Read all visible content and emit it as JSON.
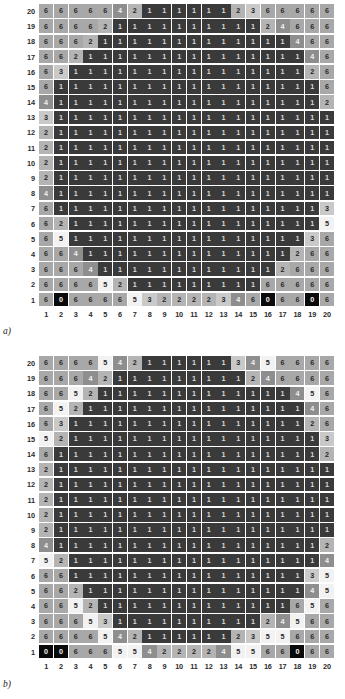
{
  "figure": {
    "panels": [
      {
        "tag": "a)",
        "name": "panel-a"
      },
      {
        "tag": "b)",
        "name": "panel-b"
      }
    ],
    "x_tick_labels": [
      "1",
      "2",
      "3",
      "4",
      "5",
      "6",
      "7",
      "8",
      "9",
      "10",
      "11",
      "12",
      "13",
      "14",
      "15",
      "16",
      "17",
      "18",
      "19",
      "20"
    ],
    "y_tick_labels": [
      "20",
      "19",
      "18",
      "17",
      "16",
      "15",
      "14",
      "13",
      "12",
      "11",
      "10",
      "9",
      "8",
      "7",
      "6",
      "5",
      "4",
      "3",
      "2",
      "1"
    ]
  },
  "legend": {
    "value_colors": {
      "0": "#0a0a0a",
      "1": "#3a3a3a",
      "2": "#b4b4b4",
      "3": "#c9c9c9",
      "4": "#8e8e8e",
      "5": "#f2f2f2",
      "6": "#a8a8a8"
    },
    "value_text_colors": {
      "0": "#f5f5f5",
      "1": "#d8d8d8",
      "2": "#262626",
      "3": "#262626",
      "4": "#f0f0f0",
      "5": "#262626",
      "6": "#2a2a2a"
    }
  },
  "chart_data": [
    {
      "type": "heatmap",
      "name": "panel-a",
      "title": "a)",
      "xlabel": "",
      "ylabel": "",
      "x": [
        1,
        2,
        3,
        4,
        5,
        6,
        7,
        8,
        9,
        10,
        11,
        12,
        13,
        14,
        15,
        16,
        17,
        18,
        19,
        20
      ],
      "y": [
        20,
        19,
        18,
        17,
        16,
        15,
        14,
        13,
        12,
        11,
        10,
        9,
        8,
        7,
        6,
        5,
        4,
        3,
        2,
        1
      ],
      "colorscale": "grayscale-discrete",
      "vmin": 0,
      "vmax": 6,
      "grid": true,
      "legend_position": "none",
      "cell_labels": true,
      "values": [
        [
          6,
          6,
          6,
          6,
          6,
          4,
          2,
          1,
          1,
          1,
          1,
          1,
          1,
          2,
          3,
          6,
          6,
          6,
          6,
          6
        ],
        [
          6,
          6,
          6,
          6,
          2,
          1,
          1,
          1,
          1,
          1,
          1,
          1,
          1,
          1,
          1,
          2,
          4,
          6,
          6,
          6
        ],
        [
          6,
          6,
          6,
          2,
          1,
          1,
          1,
          1,
          1,
          1,
          1,
          1,
          1,
          1,
          1,
          1,
          1,
          4,
          6,
          6
        ],
        [
          6,
          6,
          2,
          1,
          1,
          1,
          1,
          1,
          1,
          1,
          1,
          1,
          1,
          1,
          1,
          1,
          1,
          1,
          4,
          6
        ],
        [
          6,
          3,
          1,
          1,
          1,
          1,
          1,
          1,
          1,
          1,
          1,
          1,
          1,
          1,
          1,
          1,
          1,
          1,
          2,
          6
        ],
        [
          6,
          1,
          1,
          1,
          1,
          1,
          1,
          1,
          1,
          1,
          1,
          1,
          1,
          1,
          1,
          1,
          1,
          1,
          1,
          6
        ],
        [
          4,
          1,
          1,
          1,
          1,
          1,
          1,
          1,
          1,
          1,
          1,
          1,
          1,
          1,
          1,
          1,
          1,
          1,
          1,
          2
        ],
        [
          3,
          1,
          1,
          1,
          1,
          1,
          1,
          1,
          1,
          1,
          1,
          1,
          1,
          1,
          1,
          1,
          1,
          1,
          1,
          1
        ],
        [
          2,
          1,
          1,
          1,
          1,
          1,
          1,
          1,
          1,
          1,
          1,
          1,
          1,
          1,
          1,
          1,
          1,
          1,
          1,
          1
        ],
        [
          2,
          1,
          1,
          1,
          1,
          1,
          1,
          1,
          1,
          1,
          1,
          1,
          1,
          1,
          1,
          1,
          1,
          1,
          1,
          1
        ],
        [
          2,
          1,
          1,
          1,
          1,
          1,
          1,
          1,
          1,
          1,
          1,
          1,
          1,
          1,
          1,
          1,
          1,
          1,
          1,
          1
        ],
        [
          2,
          1,
          1,
          1,
          1,
          1,
          1,
          1,
          1,
          1,
          1,
          1,
          1,
          1,
          1,
          1,
          1,
          1,
          1,
          1
        ],
        [
          4,
          1,
          1,
          1,
          1,
          1,
          1,
          1,
          1,
          1,
          1,
          1,
          1,
          1,
          1,
          1,
          1,
          1,
          1,
          1
        ],
        [
          6,
          1,
          1,
          1,
          1,
          1,
          1,
          1,
          1,
          1,
          1,
          1,
          1,
          1,
          1,
          1,
          1,
          1,
          1,
          3
        ],
        [
          6,
          2,
          1,
          1,
          1,
          1,
          1,
          1,
          1,
          1,
          1,
          1,
          1,
          1,
          1,
          1,
          1,
          1,
          1,
          5
        ],
        [
          6,
          5,
          1,
          1,
          1,
          1,
          1,
          1,
          1,
          1,
          1,
          1,
          1,
          1,
          1,
          1,
          1,
          1,
          3,
          6
        ],
        [
          6,
          6,
          4,
          1,
          1,
          1,
          1,
          1,
          1,
          1,
          1,
          1,
          1,
          1,
          1,
          1,
          1,
          2,
          6,
          6
        ],
        [
          6,
          6,
          6,
          4,
          1,
          1,
          1,
          1,
          1,
          1,
          1,
          1,
          1,
          1,
          1,
          1,
          2,
          6,
          6,
          6
        ],
        [
          6,
          6,
          6,
          6,
          5,
          2,
          1,
          1,
          1,
          1,
          1,
          1,
          1,
          1,
          1,
          6,
          6,
          6,
          6,
          6
        ],
        [
          6,
          0,
          6,
          6,
          6,
          6,
          5,
          3,
          2,
          2,
          2,
          2,
          3,
          4,
          6,
          0,
          6,
          6,
          0,
          6
        ]
      ]
    },
    {
      "type": "heatmap",
      "name": "panel-b",
      "title": "b)",
      "xlabel": "",
      "ylabel": "",
      "x": [
        1,
        2,
        3,
        4,
        5,
        6,
        7,
        8,
        9,
        10,
        11,
        12,
        13,
        14,
        15,
        16,
        17,
        18,
        19,
        20
      ],
      "y": [
        20,
        19,
        18,
        17,
        16,
        15,
        14,
        13,
        12,
        11,
        10,
        9,
        8,
        7,
        6,
        5,
        4,
        3,
        2,
        1
      ],
      "colorscale": "grayscale-discrete",
      "vmin": 0,
      "vmax": 6,
      "grid": true,
      "legend_position": "none",
      "cell_labels": true,
      "values": [
        [
          6,
          6,
          6,
          6,
          5,
          4,
          2,
          1,
          1,
          1,
          1,
          1,
          1,
          3,
          4,
          5,
          6,
          6,
          6,
          6
        ],
        [
          6,
          6,
          6,
          4,
          2,
          1,
          1,
          1,
          1,
          1,
          1,
          1,
          1,
          1,
          2,
          4,
          6,
          6,
          6,
          6
        ],
        [
          6,
          6,
          5,
          2,
          1,
          1,
          1,
          1,
          1,
          1,
          1,
          1,
          1,
          1,
          1,
          1,
          1,
          4,
          5,
          6
        ],
        [
          6,
          5,
          2,
          1,
          1,
          1,
          1,
          1,
          1,
          1,
          1,
          1,
          1,
          1,
          1,
          1,
          1,
          1,
          4,
          6
        ],
        [
          6,
          3,
          1,
          1,
          1,
          1,
          1,
          1,
          1,
          1,
          1,
          1,
          1,
          1,
          1,
          1,
          1,
          1,
          2,
          6
        ],
        [
          5,
          2,
          1,
          1,
          1,
          1,
          1,
          1,
          1,
          1,
          1,
          1,
          1,
          1,
          1,
          1,
          1,
          1,
          1,
          3
        ],
        [
          6,
          1,
          1,
          1,
          1,
          1,
          1,
          1,
          1,
          1,
          1,
          1,
          1,
          1,
          1,
          1,
          1,
          1,
          1,
          2
        ],
        [
          2,
          1,
          1,
          1,
          1,
          1,
          1,
          1,
          1,
          1,
          1,
          1,
          1,
          1,
          1,
          1,
          1,
          1,
          1,
          1
        ],
        [
          2,
          1,
          1,
          1,
          1,
          1,
          1,
          1,
          1,
          1,
          1,
          1,
          1,
          1,
          1,
          1,
          1,
          1,
          1,
          1
        ],
        [
          2,
          1,
          1,
          1,
          1,
          1,
          1,
          1,
          1,
          1,
          1,
          1,
          1,
          1,
          1,
          1,
          1,
          1,
          1,
          1
        ],
        [
          2,
          1,
          1,
          1,
          1,
          1,
          1,
          1,
          1,
          1,
          1,
          1,
          1,
          1,
          1,
          1,
          1,
          1,
          1,
          1
        ],
        [
          2,
          1,
          1,
          1,
          1,
          1,
          1,
          1,
          1,
          1,
          1,
          1,
          1,
          1,
          1,
          1,
          1,
          1,
          1,
          1
        ],
        [
          4,
          1,
          1,
          1,
          1,
          1,
          1,
          1,
          1,
          1,
          1,
          1,
          1,
          1,
          1,
          1,
          1,
          1,
          1,
          2
        ],
        [
          5,
          2,
          1,
          1,
          1,
          1,
          1,
          1,
          1,
          1,
          1,
          1,
          1,
          1,
          1,
          1,
          1,
          1,
          1,
          4
        ],
        [
          6,
          6,
          1,
          1,
          1,
          1,
          1,
          1,
          1,
          1,
          1,
          1,
          1,
          1,
          1,
          1,
          1,
          1,
          3,
          5
        ],
        [
          6,
          6,
          2,
          1,
          1,
          1,
          1,
          1,
          1,
          1,
          1,
          1,
          1,
          1,
          1,
          1,
          1,
          1,
          4,
          5
        ],
        [
          6,
          6,
          5,
          2,
          1,
          1,
          1,
          1,
          1,
          1,
          1,
          1,
          1,
          1,
          1,
          1,
          1,
          6,
          5,
          6
        ],
        [
          6,
          6,
          6,
          5,
          3,
          1,
          1,
          1,
          1,
          1,
          1,
          1,
          1,
          1,
          1,
          2,
          4,
          5,
          6,
          6
        ],
        [
          6,
          6,
          6,
          6,
          5,
          4,
          2,
          1,
          1,
          1,
          1,
          1,
          1,
          2,
          3,
          5,
          5,
          6,
          6,
          6
        ],
        [
          0,
          0,
          6,
          6,
          6,
          5,
          5,
          4,
          2,
          2,
          2,
          2,
          4,
          5,
          5,
          6,
          6,
          0,
          6,
          6
        ]
      ]
    }
  ]
}
